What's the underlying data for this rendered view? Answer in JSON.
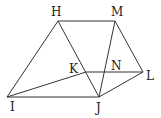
{
  "diagram": {
    "type": "geometry",
    "stroke_color": "#333333",
    "label_color": "#222222",
    "points": {
      "H": {
        "label": "H",
        "x": 58,
        "y": 21
      },
      "M": {
        "label": "M",
        "x": 115,
        "y": 21
      },
      "I": {
        "label": "I",
        "x": 7,
        "y": 97
      },
      "J": {
        "label": "J",
        "x": 99,
        "y": 97
      },
      "L": {
        "label": "L",
        "x": 143,
        "y": 72
      },
      "K": {
        "label": "K",
        "x": 86,
        "y": 72
      },
      "N": {
        "label": "N",
        "x": 105,
        "y": 72
      }
    },
    "segments": [
      [
        "H",
        "M"
      ],
      [
        "H",
        "I"
      ],
      [
        "H",
        "J"
      ],
      [
        "I",
        "J"
      ],
      [
        "I",
        "K"
      ],
      [
        "K",
        "L"
      ],
      [
        "M",
        "J"
      ],
      [
        "M",
        "L"
      ],
      [
        "J",
        "L"
      ]
    ]
  }
}
